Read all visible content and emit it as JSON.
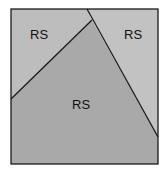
{
  "diagram": {
    "regions": [
      {
        "id": "top-left",
        "label": "RS",
        "fill": "#bdbdbd"
      },
      {
        "id": "top-right",
        "label": "RS",
        "fill": "#c2c2c2"
      },
      {
        "id": "center",
        "label": "RS",
        "fill": "#a9a9a9"
      }
    ],
    "border_color": "#1a1a1a"
  }
}
